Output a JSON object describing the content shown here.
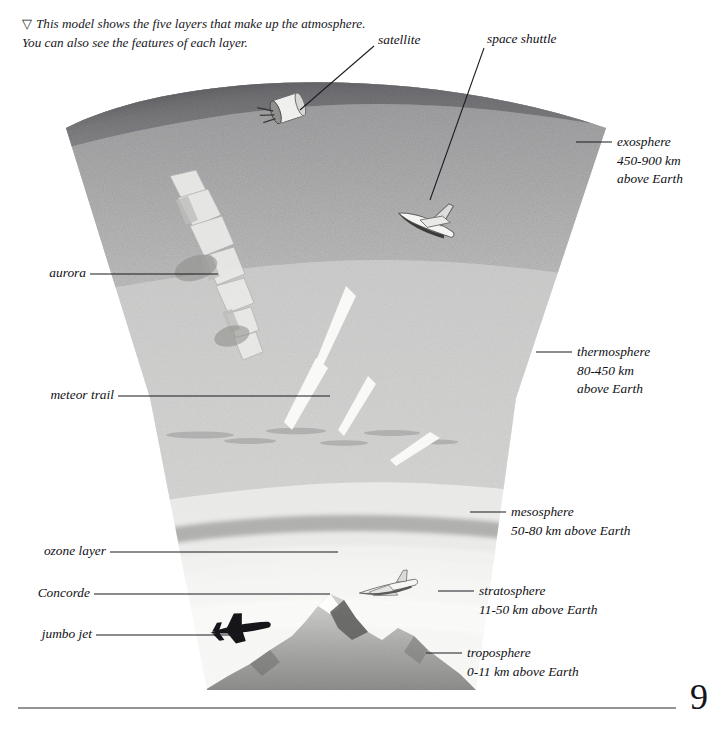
{
  "caption": {
    "marker": "▽",
    "text": "This model shows the five layers that make up the atmosphere. You can also see the features of each layer."
  },
  "page_number": "9",
  "feature_labels": [
    {
      "name": "satellite",
      "text": "satellite"
    },
    {
      "name": "space-shuttle",
      "text": "space shuttle"
    },
    {
      "name": "aurora",
      "text": "aurora"
    },
    {
      "name": "meteor-trail",
      "text": "meteor trail"
    },
    {
      "name": "ozone-layer",
      "text": "ozone layer"
    },
    {
      "name": "concorde",
      "text": "Concorde"
    },
    {
      "name": "jumbo-jet",
      "text": "jumbo jet"
    }
  ],
  "layer_labels": [
    {
      "name": "exosphere",
      "title": "exosphere",
      "range": "450-900 km",
      "suffix": "above Earth"
    },
    {
      "name": "thermosphere",
      "title": "thermosphere",
      "range": "80-450 km",
      "suffix": "above Earth"
    },
    {
      "name": "mesosphere",
      "title": "mesosphere",
      "range": "50-80 km above Earth",
      "suffix": ""
    },
    {
      "name": "stratosphere",
      "title": "stratosphere",
      "range": "11-50 km above Earth",
      "suffix": ""
    },
    {
      "name": "troposphere",
      "title": "troposphere",
      "range": "0-11 km above Earth",
      "suffix": ""
    }
  ],
  "colors": {
    "ink": "#101015",
    "rule": "#2a2a30",
    "exosphere": "#6f6f72",
    "thermosphere_top": "#9a9a9c",
    "thermosphere_bottom": "#b9b9ba",
    "mesosphere": "#c9c9c9",
    "stratosphere": "#dededd",
    "troposphere": "#eeeeed",
    "mountain": "#b4b4b2"
  }
}
